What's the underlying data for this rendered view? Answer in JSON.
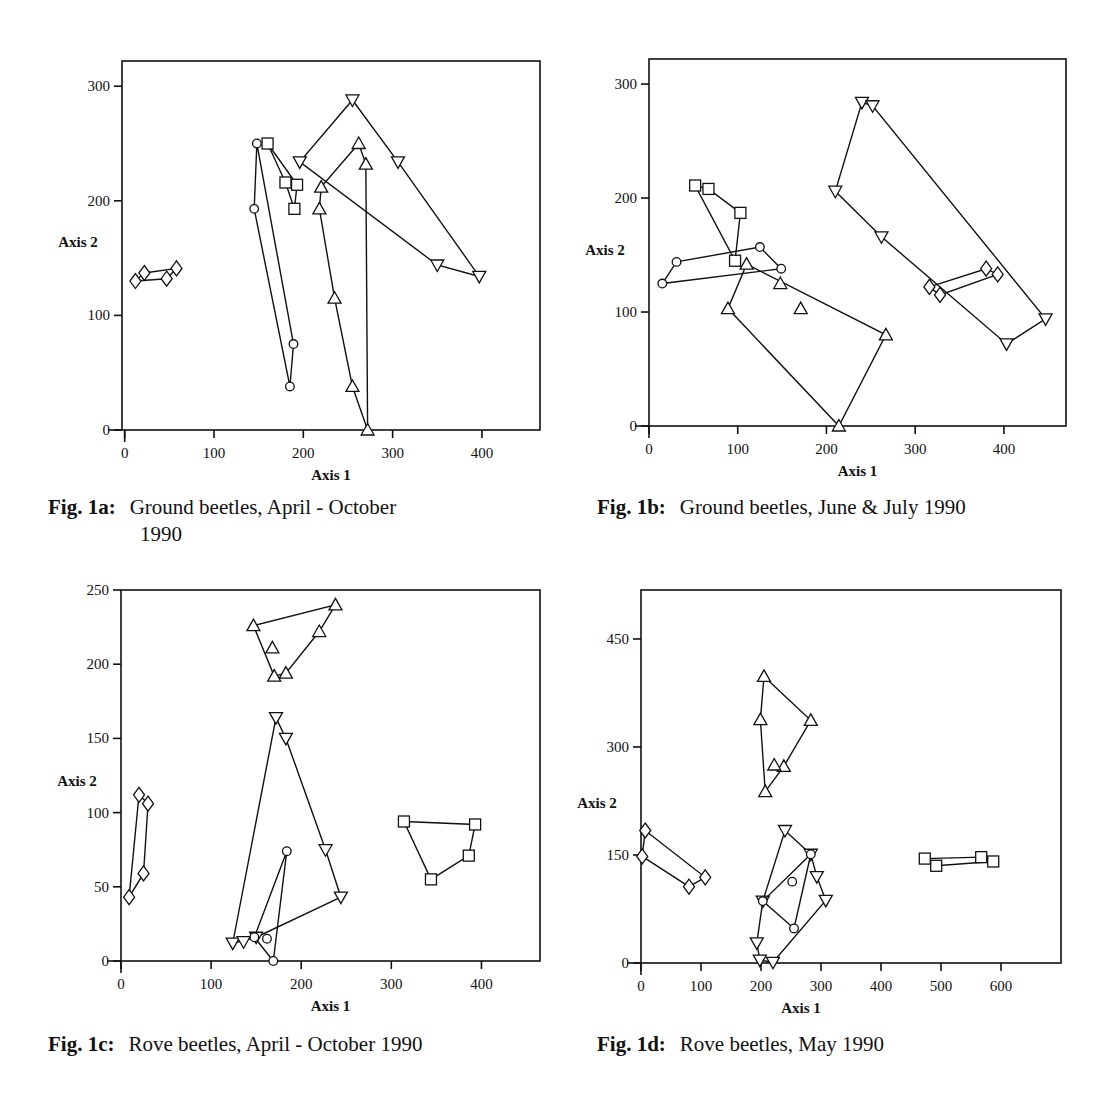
{
  "chart_data": [
    {
      "id": "fig1a",
      "type": "scatter",
      "title": "Ground beetles, April - October 1990",
      "fig_label": "Fig. 1a:",
      "caption_line1": "Ground beetles, April - October",
      "caption_line2": "1990",
      "xlabel": "Axis 1",
      "ylabel": "Axis 2",
      "xlim": [
        -3,
        465
      ],
      "ylim": [
        0,
        322
      ],
      "xticks": [
        0,
        100,
        200,
        300,
        400
      ],
      "yticks": [
        0,
        100,
        200,
        300
      ],
      "grid": false,
      "legend": "none",
      "series": [
        {
          "name": "diamond",
          "marker": "diamond",
          "points": [
            [
              12,
              130
            ],
            [
              47,
              132
            ],
            [
              58,
              141
            ],
            [
              22,
              137
            ]
          ],
          "closed": true
        },
        {
          "name": "circle",
          "marker": "circle",
          "points": [
            [
              148,
              250
            ],
            [
              189,
              75
            ],
            [
              185,
              38
            ],
            [
              145,
              193
            ]
          ],
          "closed": true
        },
        {
          "name": "square",
          "marker": "square",
          "points": [
            [
              160,
              250
            ],
            [
              193,
              214
            ],
            [
              190,
              193
            ],
            [
              180,
              216
            ]
          ],
          "closed": true
        },
        {
          "name": "triangle-up",
          "marker": "triangle-up",
          "points": [
            [
              262,
              250
            ],
            [
              220,
              212
            ],
            [
              218,
              193
            ],
            [
              235,
              115
            ],
            [
              255,
              38
            ],
            [
              272,
              0
            ],
            [
              270,
              232
            ]
          ],
          "closed": true
        },
        {
          "name": "triangle-down",
          "marker": "triangle-down",
          "points": [
            [
              255,
              288
            ],
            [
              306,
              234
            ],
            [
              397,
              134
            ],
            [
              350,
              144
            ],
            [
              196,
              234
            ]
          ],
          "closed": true
        }
      ]
    },
    {
      "id": "fig1b",
      "type": "scatter",
      "title": "Ground beetles, June & July 1990",
      "fig_label": "Fig. 1b:",
      "caption_line1": "Ground beetles, June & July 1990",
      "caption_line2": "",
      "xlabel": "Axis 1",
      "ylabel": "Axis 2",
      "xlim": [
        0,
        470
      ],
      "ylim": [
        0,
        322
      ],
      "xticks": [
        0,
        100,
        200,
        300,
        400
      ],
      "yticks": [
        0,
        100,
        200,
        300
      ],
      "grid": false,
      "legend": "none",
      "series": [
        {
          "name": "square",
          "marker": "square",
          "points": [
            [
              52,
              211
            ],
            [
              67,
              208
            ],
            [
              103,
              187
            ],
            [
              97,
              145
            ]
          ],
          "closed": true
        },
        {
          "name": "circle",
          "marker": "circle",
          "points": [
            [
              15,
              125
            ],
            [
              31,
              144
            ],
            [
              125,
              157
            ],
            [
              149,
              138
            ]
          ],
          "closed": true
        },
        {
          "name": "triangle-up",
          "marker": "triangle-up",
          "points": [
            [
              110,
              142
            ],
            [
              267,
              80
            ],
            [
              214,
              0
            ],
            [
              89,
              103
            ]
          ],
          "closed": true
        },
        {
          "name": "triangle-up-loose",
          "marker": "triangle-up",
          "points": [
            [
              148,
              125
            ],
            [
              171,
              103
            ]
          ],
          "closed": false,
          "no_lines": true
        },
        {
          "name": "diamond",
          "marker": "diamond",
          "points": [
            [
              316,
              122
            ],
            [
              380,
              138
            ],
            [
              393,
              133
            ],
            [
              328,
              115
            ]
          ],
          "closed": true
        },
        {
          "name": "triangle-down",
          "marker": "triangle-down",
          "points": [
            [
              240,
              284
            ],
            [
              252,
              281
            ],
            [
              447,
              94
            ],
            [
              403,
              72
            ],
            [
              262,
              166
            ],
            [
              210,
              206
            ]
          ],
          "closed": true
        }
      ]
    },
    {
      "id": "fig1c",
      "type": "scatter",
      "title": "Rove beetles, April - October 1990",
      "fig_label": "Fig. 1c:",
      "caption_line1": "Rove beetles, April - October 1990",
      "caption_line2": "",
      "xlabel": "Axis 1",
      "ylabel": "Axis 2",
      "xlim": [
        0,
        465
      ],
      "ylim": [
        0,
        250
      ],
      "xticks": [
        0,
        100,
        200,
        300,
        400
      ],
      "yticks": [
        0,
        50,
        100,
        150,
        200,
        250
      ],
      "grid": false,
      "legend": "none",
      "series": [
        {
          "name": "diamond",
          "marker": "diamond",
          "points": [
            [
              20,
              112
            ],
            [
              9,
              43
            ],
            [
              25,
              59
            ],
            [
              30,
              106
            ]
          ],
          "closed": true
        },
        {
          "name": "triangle-up",
          "marker": "triangle-up",
          "points": [
            [
              147,
              226
            ],
            [
              238,
              240
            ],
            [
              220,
              222
            ],
            [
              183,
              194
            ],
            [
              170,
              192
            ]
          ],
          "closed": true
        },
        {
          "name": "triangle-up-loose",
          "marker": "triangle-up",
          "points": [
            [
              168,
              211
            ]
          ],
          "closed": false,
          "no_lines": true
        },
        {
          "name": "triangle-down",
          "marker": "triangle-down",
          "points": [
            [
              172,
              164
            ],
            [
              183,
              150
            ],
            [
              227,
              75
            ],
            [
              244,
              43
            ],
            [
              150,
              16
            ],
            [
              124,
              12
            ]
          ],
          "closed": true
        },
        {
          "name": "triangle-down-loose",
          "marker": "triangle-down",
          "points": [
            [
              136,
              13
            ]
          ],
          "closed": false,
          "no_lines": true
        },
        {
          "name": "circle",
          "marker": "circle",
          "points": [
            [
              184,
              74
            ],
            [
              169,
              0
            ],
            [
              148,
              16
            ]
          ],
          "closed": true
        },
        {
          "name": "circle-loose",
          "marker": "circle",
          "points": [
            [
              162,
              15
            ]
          ],
          "closed": false,
          "no_lines": true
        },
        {
          "name": "square",
          "marker": "square",
          "points": [
            [
              314,
              94
            ],
            [
              393,
              92
            ],
            [
              386,
              71
            ],
            [
              344,
              55
            ]
          ],
          "closed": true
        }
      ]
    },
    {
      "id": "fig1d",
      "type": "scatter",
      "title": "Rove beetles, May 1990",
      "fig_label": "Fig. 1d:",
      "caption_line1": "Rove beetles, May 1990",
      "caption_line2": "",
      "xlabel": "Axis 1",
      "ylabel": "Axis 2",
      "xlim": [
        0,
        700
      ],
      "ylim": [
        0,
        518
      ],
      "xticks": [
        0,
        100,
        200,
        300,
        400,
        500,
        600
      ],
      "yticks": [
        0,
        150,
        300,
        450
      ],
      "grid": false,
      "legend": "none",
      "series": [
        {
          "name": "diamond",
          "marker": "diamond",
          "points": [
            [
              7,
              184
            ],
            [
              107,
              119
            ],
            [
              80,
              106
            ],
            [
              2,
              148
            ]
          ],
          "closed": true
        },
        {
          "name": "triangle-up",
          "marker": "triangle-up",
          "points": [
            [
              205,
              398
            ],
            [
              283,
              337
            ],
            [
              238,
              273
            ],
            [
              207,
              238
            ],
            [
              199,
              338
            ]
          ],
          "closed": true
        },
        {
          "name": "triangle-up-loose",
          "marker": "triangle-up",
          "points": [
            [
              222,
              275
            ]
          ],
          "closed": false,
          "no_lines": true
        },
        {
          "name": "triangle-down",
          "marker": "triangle-down",
          "points": [
            [
              240,
              184
            ],
            [
              283,
              151
            ],
            [
              293,
              120
            ],
            [
              308,
              87
            ],
            [
              220,
              1
            ],
            [
              198,
              4
            ],
            [
              193,
              28
            ],
            [
              203,
              86
            ]
          ],
          "closed": true
        },
        {
          "name": "circle",
          "marker": "circle",
          "points": [
            [
              283,
              151
            ],
            [
              255,
              48
            ],
            [
              203,
              86
            ]
          ],
          "closed": true
        },
        {
          "name": "circle-loose",
          "marker": "circle",
          "points": [
            [
              252,
              113
            ]
          ],
          "closed": false,
          "no_lines": true
        },
        {
          "name": "square",
          "marker": "square",
          "points": [
            [
              473,
              145
            ],
            [
              567,
              147
            ],
            [
              587,
              141
            ],
            [
              492,
              135
            ]
          ],
          "closed": true
        }
      ]
    }
  ],
  "layout": {
    "panels": [
      {
        "left": 122,
        "top": 61,
        "width": 418,
        "height": 369,
        "caption_left": 48,
        "caption_top": 494
      },
      {
        "left": 649,
        "top": 59,
        "width": 417,
        "height": 367,
        "caption_left": 597,
        "caption_top": 494
      },
      {
        "left": 121,
        "top": 590,
        "width": 419,
        "height": 371,
        "caption_left": 48,
        "caption_top": 1031
      },
      {
        "left": 641,
        "top": 590,
        "width": 420,
        "height": 373,
        "caption_left": 597,
        "caption_top": 1031
      }
    ]
  }
}
